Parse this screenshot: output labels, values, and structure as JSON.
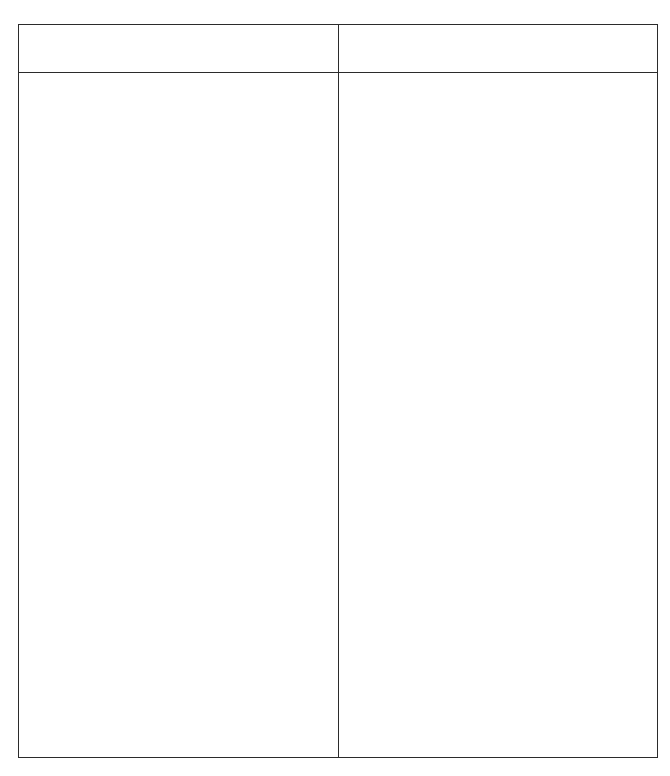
{
  "table": {
    "columns": 2,
    "header": [
      "",
      ""
    ],
    "body": [
      [
        "",
        ""
      ]
    ],
    "border_color": "#2b2b2b",
    "background": "#ffffff"
  }
}
